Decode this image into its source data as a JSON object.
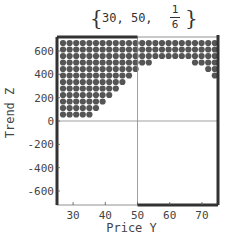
{
  "chart_data": {
    "type": "scatter",
    "title": "{30, 50, 1/6}",
    "title_parts": {
      "a": "30",
      "b": "50",
      "num": "1",
      "den": "6"
    },
    "xlabel": "Price Y",
    "ylabel": "Trend Z",
    "xlim": [
      25,
      75
    ],
    "ylim": [
      -720,
      720
    ],
    "xticks": [
      30,
      40,
      50,
      60,
      70
    ],
    "yticks": [
      600,
      400,
      200,
      0,
      -200,
      -400,
      -600
    ],
    "grid": false,
    "crosshair": {
      "x": 50,
      "y": 0
    },
    "point_color": "#555555",
    "grid_x_start": 27,
    "grid_x_step": 2.05,
    "grid_cols": 24,
    "grid_y_start": 700,
    "grid_y_step": 62,
    "grid_rows": 12,
    "column_min_row_filled": [
      11,
      11,
      11,
      11,
      11,
      10,
      9,
      8,
      7,
      6,
      5,
      4,
      3,
      3,
      2,
      2,
      2,
      2,
      2,
      2,
      3,
      3,
      4,
      5
    ]
  }
}
